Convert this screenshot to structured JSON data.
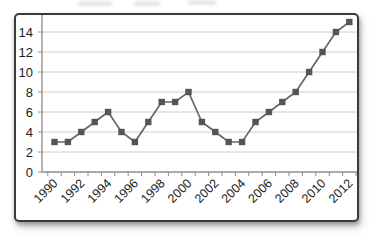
{
  "chart_data": {
    "type": "line",
    "x": [
      1990,
      1991,
      1992,
      1993,
      1994,
      1995,
      1996,
      1997,
      1998,
      1999,
      2000,
      2001,
      2002,
      2003,
      2004,
      2005,
      2006,
      2007,
      2008,
      2009,
      2010,
      2011,
      2012
    ],
    "values": [
      3,
      3,
      4,
      5,
      6,
      4,
      3,
      5,
      7,
      7,
      8,
      5,
      4,
      3,
      3,
      5,
      6,
      7,
      8,
      10,
      12,
      14,
      15
    ],
    "x_tick_labels": [
      "1990",
      "1992",
      "1994",
      "1996",
      "1998",
      "2000",
      "2002",
      "2004",
      "2006",
      "2008",
      "2010",
      "2012"
    ],
    "y_ticks": [
      0,
      2,
      4,
      6,
      8,
      10,
      12,
      14
    ],
    "ylim": [
      0,
      15.5
    ],
    "title": "",
    "xlabel": "",
    "ylabel": "",
    "legend": "none",
    "grid": "horizontal",
    "marker": "square",
    "colors": {
      "line": "#666666",
      "marker": "#555555",
      "gridline": "#cccccc",
      "axis": "#8c8c8c",
      "tick": "#8c8c8c",
      "label": "#1d1d1d",
      "panel_border": "#3a3a3a",
      "panel_background": "#ffffff"
    }
  }
}
